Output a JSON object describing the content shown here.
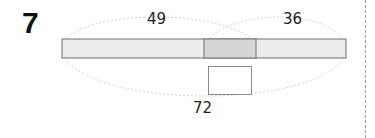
{
  "problem": {
    "number": "7"
  },
  "diagram": {
    "left_segment_label": "49",
    "right_segment_label": "36",
    "total_label": "72",
    "answer_box_value": "",
    "colors": {
      "bar_fill": "#ececec",
      "overlap_fill": "#d6d6d6",
      "bar_stroke": "#6e6e6e",
      "arc_stroke": "#d2d2d2"
    }
  }
}
